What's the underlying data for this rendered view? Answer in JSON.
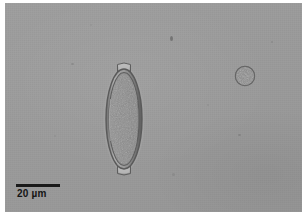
{
  "micrograph": {
    "title": "light-microscopy-micrograph",
    "modality": "brightfield light microscopy",
    "field_color": "#9b9b9b",
    "border_color": "#ffffff",
    "width_px": 308,
    "height_px": 220
  },
  "scalebar": {
    "value": "20",
    "unit": "µm",
    "label": "20 µm",
    "bar_length_px": 44,
    "color": "#141414"
  },
  "specimen": {
    "name": "trichuris-egg",
    "description": "barrel-shaped helminth egg with bipolar plugs",
    "shell_color": "#6b6b6b",
    "interior_color": "#8a8a8a",
    "plug_color": "#b4b4b4",
    "bbox": {
      "x": 96,
      "y": 58,
      "w": 46,
      "h": 116
    }
  },
  "objects": [
    {
      "name": "round-debris",
      "description": "small round granular particle",
      "bbox": {
        "x": 228,
        "y": 61,
        "w": 24,
        "h": 24
      },
      "color": "#8d8d8d"
    },
    {
      "name": "speck",
      "x": 170,
      "y": 36,
      "w": 3,
      "h": 5,
      "color": "#6d6d6d"
    },
    {
      "name": "speck",
      "x": 238,
      "y": 134,
      "w": 3,
      "h": 2,
      "color": "#7a7a7a"
    },
    {
      "name": "speck",
      "x": 172,
      "y": 173,
      "w": 3,
      "h": 3,
      "color": "#838383"
    },
    {
      "name": "speck",
      "x": 71,
      "y": 63,
      "w": 3,
      "h": 2,
      "color": "#7f7f7f"
    },
    {
      "name": "speck",
      "x": 271,
      "y": 41,
      "w": 2,
      "h": 2,
      "color": "#808080"
    },
    {
      "name": "speck",
      "x": 54,
      "y": 135,
      "w": 2,
      "h": 2,
      "color": "#888888"
    },
    {
      "name": "speck",
      "x": 207,
      "y": 104,
      "w": 2,
      "h": 2,
      "color": "#8a8a8a"
    },
    {
      "name": "speck",
      "x": 90,
      "y": 24,
      "w": 2,
      "h": 2,
      "color": "#8b8b8b"
    }
  ]
}
